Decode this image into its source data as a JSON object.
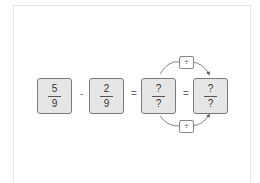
{
  "equation": {
    "fractions": [
      {
        "numerator": "5",
        "denominator": "9"
      },
      {
        "numerator": "2",
        "denominator": "9"
      },
      {
        "numerator": "?",
        "denominator": "?"
      },
      {
        "numerator": "?",
        "denominator": "?"
      }
    ],
    "operators": [
      "-",
      "=",
      "="
    ],
    "arrows": [
      {
        "position": "top",
        "label": "÷"
      },
      {
        "position": "bottom",
        "label": "÷"
      }
    ]
  },
  "colors": {
    "box_fill": "#e6e6e6",
    "box_border": "#7a7a7a",
    "arrow": "#555555"
  }
}
